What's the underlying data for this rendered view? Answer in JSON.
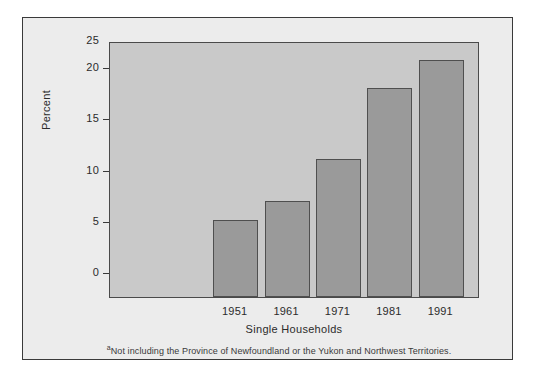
{
  "chart_data": {
    "type": "bar",
    "title": "",
    "subtitle": "",
    "xlabel": "Single Households",
    "ylabel": "Percent",
    "categories": [
      "1951",
      "1961",
      "1971",
      "1981",
      "1991"
    ],
    "values": [
      7.5,
      9.4,
      13.5,
      20.4,
      23.1
    ],
    "series": [
      {
        "name": "Single Households",
        "values": [
          7.5,
          9.4,
          13.5,
          20.4,
          23.1
        ]
      }
    ],
    "ylim": [
      0,
      25
    ],
    "y_ticks": [
      0,
      5,
      10,
      15,
      20,
      25
    ],
    "y_tick_labels": [
      "0",
      "5",
      "10",
      "15",
      "20",
      "25"
    ],
    "grid": false,
    "legend": "none",
    "bar_color": "#9a9a9a",
    "bar_edge_color": "#4f4f4f",
    "plot_background": "#c9c9c9",
    "figure_background": "#ececec",
    "axis_color": "#3a3a3a"
  },
  "footnote": {
    "marker": "a",
    "text": "Not including the Province of Newfoundland or the Yukon and Northwest Territories."
  }
}
